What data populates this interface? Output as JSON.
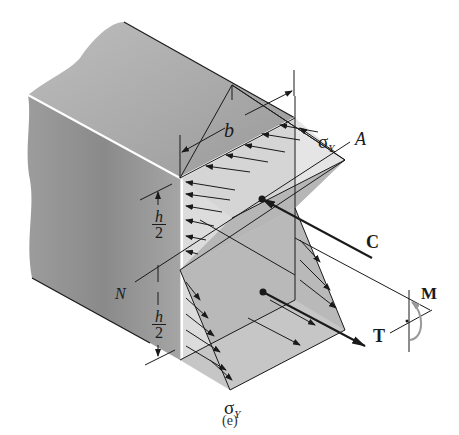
{
  "figure": {
    "caption": "(e)",
    "labels": {
      "width": "b",
      "sigma_top": "σ",
      "sigma_top_sub": "Y",
      "point_a": "A",
      "half_height_top_num": "h",
      "half_height_top_den": "2",
      "half_height_bottom_num": "h",
      "half_height_bottom_den": "2",
      "neutral_axis": "N",
      "compression": "C",
      "tension": "T",
      "moment": "M",
      "sigma_bottom": "σ",
      "sigma_bottom_sub": "Y"
    },
    "colors": {
      "beam_top": "#a9a9a9",
      "beam_side": "#8e8e8e",
      "section_face": "#d9d9d9",
      "stress_block": "#b5b5b5",
      "lines": "#1a1a1a",
      "moment_arrow": "#9a9a9a"
    }
  }
}
